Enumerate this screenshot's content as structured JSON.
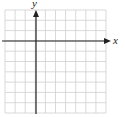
{
  "diagram": {
    "type": "coordinate-grid",
    "axes": {
      "x_label": "x",
      "y_label": "y"
    },
    "grid": {
      "columns": 10,
      "rows": 10,
      "origin_col": 3,
      "origin_row": 3
    },
    "colors": {
      "grid": "#c8c8c8",
      "axis": "#222222",
      "background": "#ffffff"
    }
  }
}
